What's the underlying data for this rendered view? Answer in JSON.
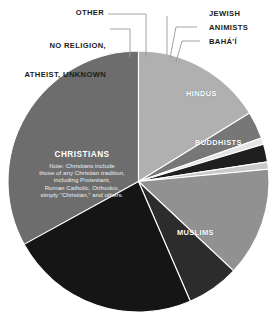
{
  "chart_data": {
    "type": "pie",
    "title": "",
    "subtitle": "",
    "legend_position": "callout-labels",
    "grid": false,
    "categories": [
      "Christians",
      "Muslims",
      "Buddhists",
      "Hindus",
      "Bahá'í",
      "Animists",
      "Jewish",
      "Other",
      "No religion, atheist, unknown"
    ],
    "values": [
      33.0,
      23.5,
      6.5,
      13.5,
      0.9,
      2.2,
      0.8,
      3.4,
      16.2
    ],
    "unit": "percent of world population",
    "slices": [
      {
        "label": "CHRISTIANS",
        "value": 33.0,
        "color": "#6d6d6d",
        "label_color": "#ffffff",
        "label_placement": "inside"
      },
      {
        "label": "MUSLIMS",
        "value": 23.5,
        "color": "#151515",
        "label_color": "#ffffff",
        "label_placement": "inside"
      },
      {
        "label": "BUDDHISTS",
        "value": 6.5,
        "color": "#2c2c2c",
        "label_color": "#ffffff",
        "label_placement": "inside"
      },
      {
        "label": "HINDUS",
        "value": 13.5,
        "color": "#919191",
        "label_color": "#ffffff",
        "label_placement": "inside"
      },
      {
        "label": "BAHÁ'Í",
        "value": 0.9,
        "color": "#c9c9c9",
        "label_color": "#1b1b1b",
        "label_placement": "callout-right"
      },
      {
        "label": "ANIMISTS",
        "value": 2.2,
        "color": "#1f1f1f",
        "label_color": "#1b1b1b",
        "label_placement": "callout-right"
      },
      {
        "label": "JEWISH",
        "value": 0.8,
        "color": "#e4e4e4",
        "label_color": "#1b1b1b",
        "label_placement": "callout-right"
      },
      {
        "label": "OTHER",
        "value": 3.4,
        "color": "#777777",
        "label_color": "#1b1b1b",
        "label_placement": "callout-left"
      },
      {
        "label": "NO RELIGION,\nATHEIST, UNKNOWN",
        "value": 16.2,
        "color": "#b0b0b0",
        "label_color": "#1b1b1b",
        "label_placement": "callout-left"
      }
    ]
  },
  "labels": {
    "other": "OTHER",
    "no_religion_line1": "NO RELIGION,",
    "no_religion_line2": "ATHEIST, UNKNOWN",
    "jewish": "JEWISH",
    "animists": "ANIMISTS",
    "bahai": "BAHÁ'Í",
    "hindus": "HINDUS",
    "buddhists": "BUDDHISTS",
    "muslims": "MUSLIMS",
    "christians": "CHRISTIANS"
  },
  "christians_note": {
    "line1": "Note: Christians include",
    "line2": "those of any Christian tradition,",
    "line3": "including Protestant,",
    "line4": "Roman Catholic, Orthodox,",
    "line5": "simply \"Christian,\" and others."
  },
  "colors": {
    "background": "#ffffff",
    "christians": "#6d6d6d",
    "muslims": "#151515",
    "buddhists": "#2c2c2c",
    "hindus": "#919191",
    "bahai": "#c9c9c9",
    "animists": "#1f1f1f",
    "jewish": "#e4e4e4",
    "other": "#777777",
    "no_religion": "#b0b0b0",
    "leader_line": "#9a9a9a",
    "label_text": "#1b1b1b",
    "inside_label_text": "#ffffff"
  }
}
